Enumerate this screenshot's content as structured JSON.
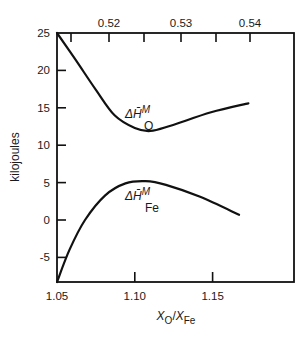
{
  "chart_data": {
    "type": "line",
    "title": "",
    "xlabel": "X_O/X_Fe",
    "xlabel_parts": {
      "main": "X",
      "sub1": "O",
      "sep": "/",
      "main2": "X",
      "sub2": "Fe"
    },
    "ylabel": "kilojoules",
    "xlim": [
      1.05,
      1.203
    ],
    "ylim": [
      -8.3,
      25
    ],
    "grid": false,
    "legend": "none (inline curve labels)",
    "x_ticks": [
      1.05,
      1.1,
      1.15
    ],
    "x_tick_labels": [
      "1.05",
      "1.10",
      "1.15"
    ],
    "y_ticks": [
      25,
      20,
      15,
      10,
      5,
      0,
      -5
    ],
    "y_tick_labels": [
      "25",
      "20",
      "15",
      "10",
      "5",
      "0",
      "-5"
    ],
    "top_axis": {
      "tick_labels": [
        "0.52",
        "0.53",
        "0.54"
      ],
      "labeled_tick_px": [
        109,
        181,
        250
      ],
      "minor_tick_px": [
        71,
        144,
        216
      ]
    },
    "series": [
      {
        "name": "ΔH̄M O",
        "label_main": "ΔH̄",
        "label_sup": "M",
        "label_sub": "O",
        "x": [
          1.05,
          1.062,
          1.075,
          1.087,
          1.1,
          1.11,
          1.123,
          1.149,
          1.173
        ],
        "y": [
          25.0,
          21.4,
          17.4,
          14.0,
          12.3,
          11.9,
          12.6,
          14.4,
          15.6
        ]
      },
      {
        "name": "ΔH̄M Fe",
        "label_main": "ΔH̄",
        "label_sup": "M",
        "label_sub": "Fe",
        "x": [
          1.05,
          1.058,
          1.068,
          1.081,
          1.094,
          1.107,
          1.12,
          1.142,
          1.167
        ],
        "y": [
          -8.3,
          -4.0,
          0.0,
          3.3,
          4.9,
          5.2,
          4.7,
          3.1,
          0.7
        ]
      }
    ],
    "colors": {
      "line": "#111111",
      "background": "#ffffff"
    }
  }
}
